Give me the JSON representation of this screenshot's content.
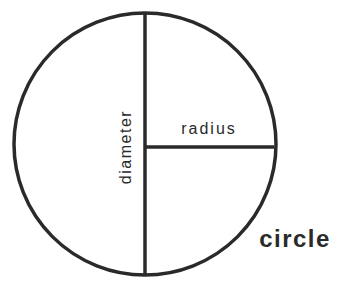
{
  "diagram": {
    "labels": {
      "diameter": "diameter",
      "radius": "radius",
      "title": "circle"
    },
    "colors": {
      "stroke": "#2a2a2a",
      "background": "#ffffff"
    }
  }
}
